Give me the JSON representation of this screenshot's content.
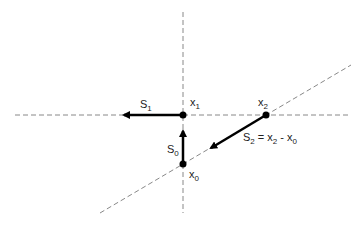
{
  "diagram": {
    "colors": {
      "axis": "#888888",
      "vector": "#000000",
      "point": "#000000",
      "text": "#222222"
    },
    "points": {
      "x0": {
        "base": "x",
        "sub": "0"
      },
      "x1": {
        "base": "x",
        "sub": "1"
      },
      "x2": {
        "base": "x",
        "sub": "2"
      }
    },
    "vectors": {
      "s0": {
        "base": "S",
        "sub": "0",
        "from": "x0",
        "to": "x1"
      },
      "s1": {
        "base": "S",
        "sub": "1",
        "from": "x1",
        "direction": "left"
      },
      "s2": {
        "base": "S",
        "sub": "2",
        "from": "x2",
        "direction": "toward x0",
        "equation_rhs": [
          {
            "base": "x",
            "sub": "2"
          },
          {
            "op": " - "
          },
          {
            "base": "x",
            "sub": "0"
          }
        ]
      }
    },
    "labels": {
      "equals": " = ",
      "minus": " - "
    }
  }
}
